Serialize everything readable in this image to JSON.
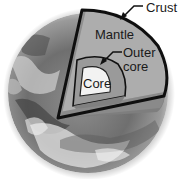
{
  "diagram": {
    "labels": {
      "crust": "Crust",
      "mantle": "Mantle",
      "outer_core_line1": "Outer",
      "outer_core_line2": "core",
      "core": "Core"
    },
    "colors": {
      "background": "#ffffff",
      "outline": "#0f0f0f",
      "mantle_face_top": "#a9a9a9",
      "mantle_face_bottom": "#8a8a8a",
      "outer_core": "#9a9a9a",
      "core": "#f2f2f2",
      "earth_dark": "#4a4a4a",
      "earth_light": "#d8d8d8"
    }
  }
}
